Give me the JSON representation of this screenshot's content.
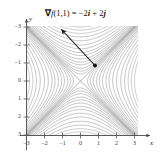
{
  "figure": {
    "annotation": {
      "nabla": "∇",
      "fn": "f",
      "args": "(1,1)",
      "equals": " = ",
      "term1_coef": "−2",
      "term1_unit": "i",
      "plus": " + ",
      "term2_coef": "2",
      "term2_unit": "j",
      "full_text": "∇f(1,1) = −2i + 2j"
    },
    "axes": {
      "x_name": "x",
      "y_name": "y",
      "x_ticks": [
        "−3",
        "−2",
        "−1",
        "0",
        "1",
        "2",
        "3"
      ],
      "y_ticks": [
        "3",
        "2",
        "1",
        "0",
        "−1",
        "−2",
        "−3"
      ],
      "x_range": [
        -3,
        3
      ],
      "y_range": [
        -3,
        3
      ]
    },
    "colors": {
      "contour": "#a8a8a8",
      "contour_dark": "#8e8e8e",
      "asymptote": "#9a9a9a",
      "axis": "#555555",
      "arrow": "#1a1a1a",
      "background": "#ffffff"
    }
  },
  "chart_data": {
    "type": "line",
    "title": "",
    "subtitle": "",
    "xlabel": "x",
    "ylabel": "y",
    "xlim": [
      -3,
      3
    ],
    "ylim": [
      -3,
      3
    ],
    "grid": false,
    "legend": null,
    "plot_kind": "contour",
    "function": "f(x,y) = y^2 - x^2",
    "contour_levels": [
      -9,
      -8,
      -7,
      -6,
      -5,
      -4,
      -3.2,
      -2.5,
      -2,
      -1.5,
      -1.1,
      -0.8,
      -0.5,
      -0.3,
      -0.15,
      0,
      0.15,
      0.3,
      0.5,
      0.8,
      1.1,
      1.5,
      2,
      2.5,
      3.2,
      4,
      5,
      6,
      7,
      8,
      9
    ],
    "annotations": [
      {
        "text": "∇f(1,1) = −2i + 2j",
        "type": "vector",
        "base_point": [
          1,
          1
        ],
        "vector": [
          -2,
          2
        ],
        "tip_point": [
          -1,
          3
        ],
        "arrowhead_at": "tip",
        "dot_at": "base"
      }
    ],
    "x_ticks": [
      -3,
      -2,
      -1,
      0,
      1,
      2,
      3
    ],
    "y_ticks": [
      -3,
      -2,
      -1,
      0,
      1,
      2,
      3
    ]
  }
}
